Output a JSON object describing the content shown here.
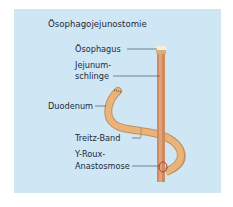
{
  "figure": {
    "title": "Ösophagojejunostomie",
    "labels": {
      "oesophagus": "Ösophagus",
      "jejunum_line1": "Jejunum-",
      "jejunum_line2": "schlinge",
      "duodenum": "Duodenum",
      "treitz": "Treitz-Band",
      "roux_line1": "Y-Roux-",
      "roux_line2": "Anastosmose"
    },
    "colors": {
      "background": "#cfe6f5",
      "jejunum_tube": "#d9936a",
      "duodenum_tube": "#e5b078",
      "text": "#1e2a38"
    }
  }
}
